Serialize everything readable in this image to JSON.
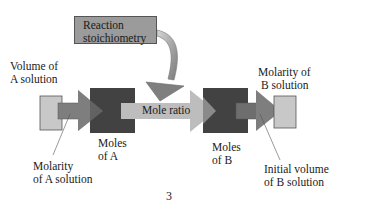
{
  "diagram": {
    "title_box": {
      "label_line1": "Reaction",
      "label_line2": "stoichiometry"
    },
    "left": {
      "top_label_line1": "Volume of",
      "top_label_line2": "A solution",
      "bottom_label_line1": "Molarity",
      "bottom_label_line2": "of A solution",
      "moles_line1": "Moles",
      "moles_line2": "of A"
    },
    "center": {
      "arrow_label": "Mole ratio"
    },
    "right": {
      "top_label_line1": "Molarity of",
      "top_label_line2": "B solution",
      "bottom_label_line1": "Initial volume",
      "bottom_label_line2": "of B solution",
      "moles_line1": "Moles",
      "moles_line2": "of B"
    },
    "page_number": "3",
    "colors": {
      "light_square": "#c8c8c8",
      "medium_arrow": "#7e7e7e",
      "dark_square": "#424242",
      "mole_ratio_arrow": "#bdbdbd",
      "stoich_box": "#9b9b9b",
      "curved_arrow": "#8a8a8a"
    }
  }
}
